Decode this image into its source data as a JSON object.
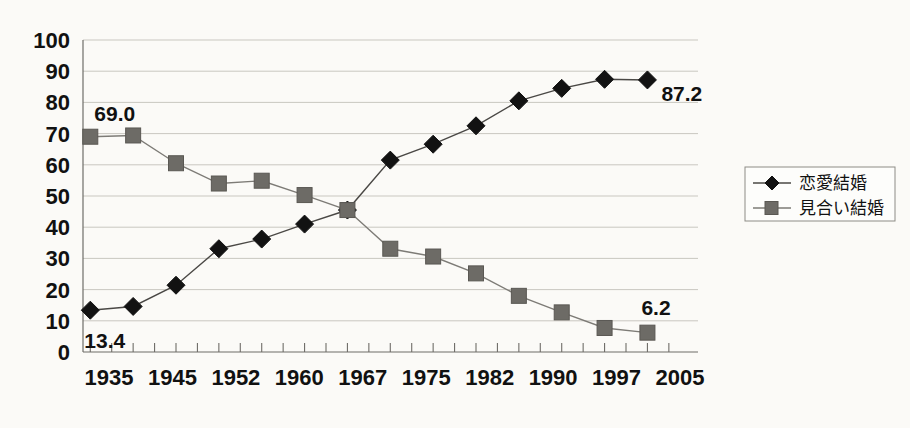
{
  "chart_data": {
    "type": "line",
    "title": "",
    "subtitle": "",
    "xlabel": "",
    "ylabel": "",
    "ylim": [
      0,
      100
    ],
    "ytick_step": 10,
    "yticks": [
      "100",
      "90",
      "80",
      "70",
      "60",
      "50",
      "40",
      "30",
      "20",
      "10",
      "0"
    ],
    "xticks": [
      "1935",
      "1945",
      "1952",
      "1960",
      "1967",
      "1975",
      "1982",
      "1990",
      "1997",
      "2005"
    ],
    "x": [
      "1935",
      "1940",
      "1945",
      "1950",
      "1952",
      "1957",
      "1960",
      "1964",
      "1967",
      "1972",
      "1975",
      "1979",
      "1982",
      "1986",
      "1990",
      "1993",
      "1997",
      "2001",
      "2005"
    ],
    "categories": [
      "1935",
      "1943",
      "1948",
      "1952",
      "1956",
      "1962",
      "1967",
      "1972",
      "1978",
      "1982",
      "1988",
      "1992",
      "1997",
      "2002"
    ],
    "grid": true,
    "legend_position": "right",
    "series": [
      {
        "name": "恋愛結婚",
        "marker": "diamond",
        "color": "#121212",
        "values": [
          13.4,
          14.6,
          21.4,
          33.1,
          36.2,
          41.0,
          45.5,
          61.5,
          66.6,
          72.5,
          80.5,
          84.5,
          87.4,
          87.2
        ]
      },
      {
        "name": "見合い結婚",
        "marker": "square",
        "color": "#6d6b66",
        "values": [
          69.0,
          69.4,
          60.5,
          54.0,
          54.9,
          50.3,
          45.5,
          33.1,
          30.6,
          25.2,
          18.0,
          12.7,
          7.7,
          6.2
        ]
      }
    ],
    "annotations": [
      {
        "text": "69.0",
        "series": "見合い結婚",
        "point_index": 0,
        "position": "above"
      },
      {
        "text": "13.4",
        "series": "恋愛結婚",
        "point_index": 0,
        "position": "below"
      },
      {
        "text": "87.2",
        "series": "恋愛結婚",
        "point_index": 13,
        "position": "right-below"
      },
      {
        "text": "6.2",
        "series": "見合い結婚",
        "point_index": 13,
        "position": "above-right"
      }
    ]
  },
  "legend": {
    "items": [
      {
        "label": "恋愛結婚",
        "marker": "diamond"
      },
      {
        "label": "見合い結婚",
        "marker": "square"
      }
    ]
  }
}
